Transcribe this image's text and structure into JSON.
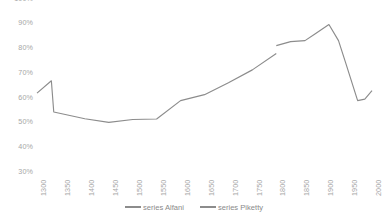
{
  "chart_data": {
    "type": "line",
    "title": "",
    "subtitle": "",
    "xlabel": "",
    "ylabel": "",
    "grid": false,
    "legend_position": "bottom",
    "x": [
      1300,
      1350,
      1400,
      1450,
      1500,
      1550,
      1600,
      1650,
      1700,
      1750,
      1800,
      1850,
      1900,
      1950,
      2000
    ],
    "xtick_labels": [
      "1300",
      "1350",
      "1400",
      "1450",
      "1500",
      "1550",
      "1600",
      "1650",
      "1700",
      "1750",
      "1800",
      "1850",
      "1900",
      "1950",
      "2000"
    ],
    "xlim": [
      1300,
      2000
    ],
    "ytick_labels": [
      "100%",
      "90%",
      "80%",
      "70%",
      "60%",
      "50%",
      "40%",
      "30%"
    ],
    "ytick_values": [
      100,
      90,
      80,
      70,
      60,
      50,
      40,
      30
    ],
    "ylim": [
      30,
      100
    ],
    "yaxis_unit": "%",
    "series": [
      {
        "name": "series Alfani",
        "color": "#8c8c8c",
        "points": [
          {
            "x": 1300,
            "y": 61.8
          },
          {
            "x": 1330,
            "y": 66.8
          },
          {
            "x": 1335,
            "y": 54.2
          },
          {
            "x": 1400,
            "y": 51.5
          },
          {
            "x": 1450,
            "y": 50.0
          },
          {
            "x": 1500,
            "y": 51.2
          },
          {
            "x": 1550,
            "y": 51.4
          },
          {
            "x": 1600,
            "y": 58.8
          },
          {
            "x": 1650,
            "y": 61.2
          },
          {
            "x": 1700,
            "y": 66.0
          },
          {
            "x": 1750,
            "y": 71.2
          },
          {
            "x": 1800,
            "y": 77.8
          }
        ]
      },
      {
        "name": "series Piketty",
        "color": "#8c8c8c",
        "points": [
          {
            "x": 1800,
            "y": 81.0
          },
          {
            "x": 1830,
            "y": 82.6
          },
          {
            "x": 1860,
            "y": 83.0
          },
          {
            "x": 1880,
            "y": 85.6
          },
          {
            "x": 1910,
            "y": 89.5
          },
          {
            "x": 1930,
            "y": 83.0
          },
          {
            "x": 1945,
            "y": 74.0
          },
          {
            "x": 1970,
            "y": 58.8
          },
          {
            "x": 1985,
            "y": 59.4
          },
          {
            "x": 2000,
            "y": 62.8
          }
        ]
      }
    ],
    "legend": [
      {
        "label": "series Alfani",
        "color": "#8c8c8c"
      },
      {
        "label": "series Piketty",
        "color": "#8c8c8c"
      }
    ]
  },
  "legend": {
    "entries": [
      {
        "label": "series Alfani"
      },
      {
        "label": "series Piketty"
      }
    ]
  },
  "axes": {
    "y": {
      "ticks": [
        "100%",
        "90%",
        "80%",
        "70%",
        "60%",
        "50%",
        "40%",
        "30%"
      ]
    },
    "x": {
      "ticks": [
        "1300",
        "1350",
        "1400",
        "1450",
        "1500",
        "1550",
        "1600",
        "1650",
        "1700",
        "1750",
        "1800",
        "1850",
        "1900",
        "1950",
        "2000"
      ]
    }
  }
}
